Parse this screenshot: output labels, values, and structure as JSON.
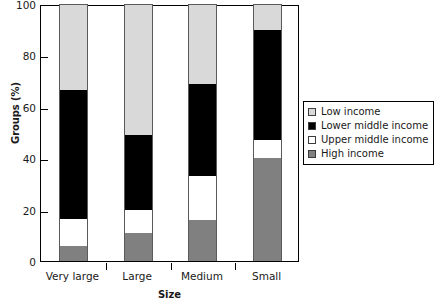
{
  "chart_data": {
    "type": "bar",
    "subtype": "stacked-vertical-100percent",
    "title": "",
    "xlabel": "Size",
    "ylabel": "Groups (%)",
    "categories": [
      "Very large",
      "Large",
      "Medium",
      "Small"
    ],
    "ylim": [
      0,
      100
    ],
    "yticks": [
      0,
      20,
      40,
      60,
      80,
      100
    ],
    "ytick_labels": [
      "0",
      "20",
      "40",
      "60",
      "80",
      "100"
    ],
    "grid": false,
    "legend_position": "right-middle-outside",
    "series": [
      {
        "name": "Low income",
        "color": "#d9d9d9",
        "values": [
          33.5,
          51.0,
          31.0,
          10.0
        ]
      },
      {
        "name": "Lower middle income",
        "color": "#000000",
        "values": [
          50.0,
          29.0,
          36.0,
          43.0
        ]
      },
      {
        "name": "Upper middle income",
        "color": "#ffffff",
        "values": [
          10.5,
          9.0,
          17.0,
          7.0
        ]
      },
      {
        "name": "High income",
        "color": "#808080",
        "values": [
          6.0,
          11.0,
          16.0,
          40.0
        ]
      }
    ],
    "cumulative_tops": {
      "Very large": {
        "High income": 6.0,
        "Upper middle income": 16.5,
        "Lower middle income": 66.5,
        "Low income": 100
      },
      "Large": {
        "High income": 11.0,
        "Upper middle income": 20.0,
        "Lower middle income": 49.0,
        "Low income": 100
      },
      "Medium": {
        "High income": 16.0,
        "Upper middle income": 33.0,
        "Lower middle income": 69.0,
        "Low income": 100
      },
      "Small": {
        "High income": 40.0,
        "Upper middle income": 47.0,
        "Lower middle income": 90.0,
        "Low income": 100
      }
    },
    "legend_entries": [
      {
        "label": "Low income",
        "color": "#d9d9d9"
      },
      {
        "label": "Lower middle income",
        "color": "#000000"
      },
      {
        "label": "Upper middle income",
        "color": "#ffffff"
      },
      {
        "label": "High income",
        "color": "#808080"
      }
    ]
  }
}
